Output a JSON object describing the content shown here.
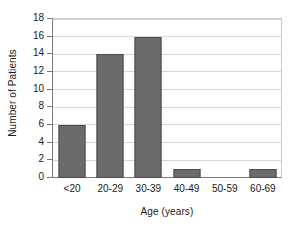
{
  "chart_data": {
    "type": "bar",
    "title": "",
    "xlabel": "Age (years)",
    "ylabel": "Number of Patients",
    "categories": [
      "<20",
      "20-29",
      "30-39",
      "40-49",
      "50-59",
      "60-69"
    ],
    "values": [
      6,
      14,
      16,
      1,
      0,
      1
    ],
    "ylim": [
      0,
      18
    ],
    "yticks": [
      0,
      2,
      4,
      6,
      8,
      10,
      12,
      14,
      16,
      18
    ],
    "ytick_labels": [
      "0",
      "2",
      "4",
      "6",
      "8",
      "10",
      "12",
      "14",
      "16",
      "18"
    ],
    "grid": "horizontal",
    "legend": "none",
    "series": [
      {
        "name": "Number of Patients",
        "values": [
          6,
          14,
          16,
          1,
          0,
          1
        ]
      }
    ],
    "colors": {
      "bar_fill": "#6b6b6b",
      "bar_border": "#4d4d4d",
      "gridline": "#d8d8d8",
      "axis": "#7a7a7a",
      "text": "#1a1a1a",
      "background": "#ffffff"
    }
  }
}
